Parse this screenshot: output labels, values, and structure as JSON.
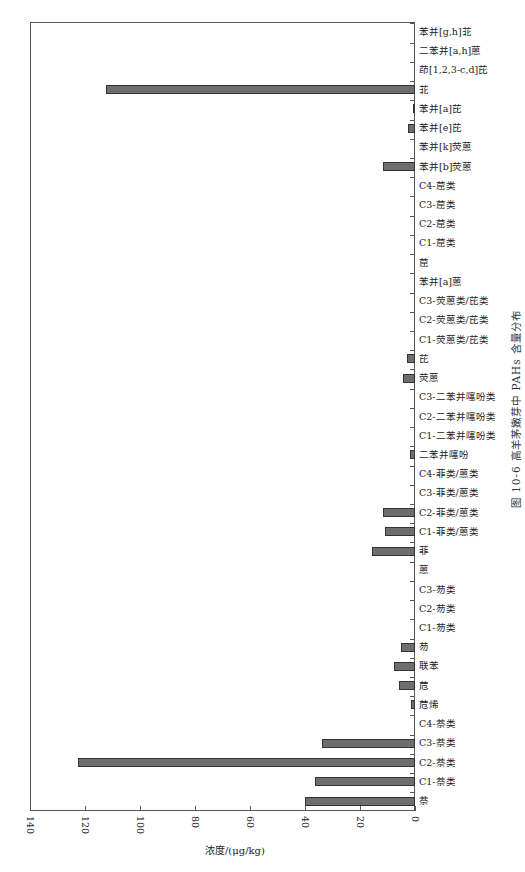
{
  "chart_data": {
    "type": "bar",
    "orientation": "horizontal (rotated page; bars grow leftward from 0)",
    "title": "",
    "caption": "图 10-6   高羊茅嫩芽中 PAHs 含量分布",
    "xlabel": "浓度/(μg/kg)",
    "ylabel": "",
    "xlim": [
      0,
      140
    ],
    "xticks": [
      140,
      120,
      100,
      80,
      60,
      40,
      20,
      0
    ],
    "grid": false,
    "legend": null,
    "categories": [
      "萘",
      "C1-萘类",
      "C2-萘类",
      "C3-萘类",
      "C4-萘类",
      "苊烯",
      "苊",
      "联苯",
      "芴",
      "C1-芴类",
      "C2-芴类",
      "C3-芴类",
      "蒽",
      "菲",
      "C1-菲类/蒽类",
      "C2-菲类/蒽类",
      "C3-菲类/蒽类",
      "C4-菲类/蒽类",
      "二苯并噻吩",
      "C1-二苯并噻吩类",
      "C2-二苯并噻吩类",
      "C3-二苯并噻吩类",
      "荧蒽",
      "芘",
      "C1-荧蒽类/芘类",
      "C2-荧蒽类/芘类",
      "C3-荧蒽类/芘类",
      "苯并[a]蒽",
      "䓛",
      "C1-䓛类",
      "C2-䓛类",
      "C3-䓛类",
      "C4-䓛类",
      "苯并[b]荧蒽",
      "苯并[k]荧蒽",
      "苯并[e]芘",
      "苯并[a]芘",
      "苝",
      "茚[1,2,3-c,d]芘",
      "二苯并[a,h]蒽",
      "苯并[g,h]苝"
    ],
    "values": [
      40,
      36.5,
      122.5,
      34,
      0,
      1.5,
      6,
      7.5,
      5,
      0,
      0,
      0,
      0,
      15.5,
      11,
      11.5,
      0,
      0,
      2,
      0,
      0,
      0,
      4.5,
      3,
      0,
      0,
      0,
      0,
      0,
      0,
      0,
      0,
      0,
      11.5,
      0,
      2.5,
      0.8,
      112.5,
      0,
      0,
      0
    ]
  }
}
